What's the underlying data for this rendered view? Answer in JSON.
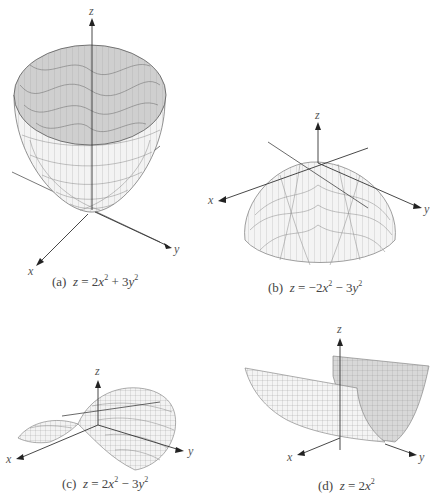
{
  "figure": {
    "panels": [
      {
        "id": "a",
        "label": "(a)",
        "equation": "z = 2x² + 3y²",
        "surface": "elliptic paraboloid opening upward",
        "axes": [
          "x",
          "y",
          "z"
        ]
      },
      {
        "id": "b",
        "label": "(b)",
        "equation": "z = −2x² − 3y²",
        "surface": "elliptic paraboloid opening downward",
        "axes": [
          "x",
          "y",
          "z"
        ]
      },
      {
        "id": "c",
        "label": "(c)",
        "equation": "z = 2x² − 3y²",
        "surface": "hyperbolic paraboloid (saddle)",
        "axes": [
          "x",
          "y",
          "z"
        ]
      },
      {
        "id": "d",
        "label": "(d)",
        "equation": "z = 2x²",
        "surface": "parabolic cylinder",
        "axes": [
          "x",
          "y",
          "z"
        ]
      }
    ],
    "colors": {
      "axis": "#333333",
      "mesh": "#777777",
      "surface_inner": "#c8c8c8",
      "surface_outer": "#f2f2f2"
    }
  },
  "captions": {
    "a": {
      "prefix": "(a)",
      "lhs": "z",
      "eq": " = 2",
      "v1": "x",
      "op": " + 3",
      "v2": "y"
    },
    "b": {
      "prefix": "(b)",
      "lhs": "z",
      "eq": " = −2",
      "v1": "x",
      "op": " − 3",
      "v2": "y"
    },
    "c": {
      "prefix": "(c)",
      "lhs": "z",
      "eq": " = 2",
      "v1": "x",
      "op": " − 3",
      "v2": "y"
    },
    "d": {
      "prefix": "(d)",
      "lhs": "z",
      "eq": " = 2",
      "v1": "x"
    }
  },
  "axis_labels": {
    "x": "x",
    "y": "y",
    "z": "z"
  }
}
